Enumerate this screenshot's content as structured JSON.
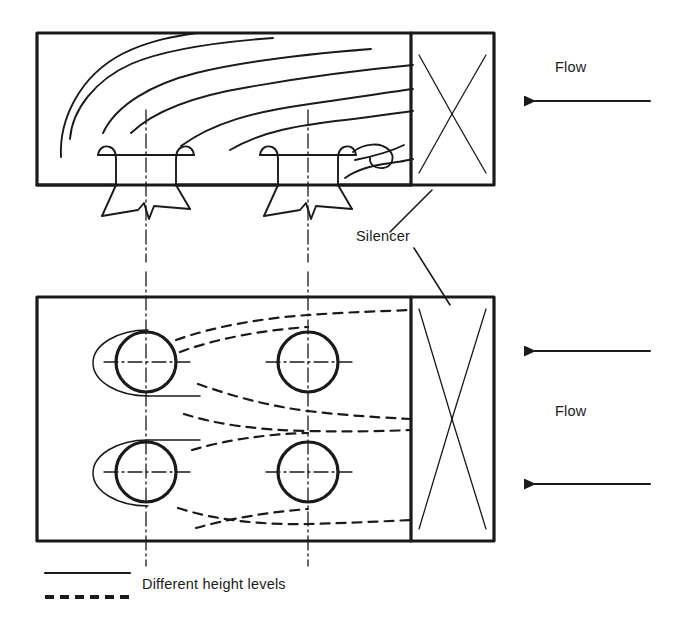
{
  "figure": {
    "background_color": "#ffffff",
    "line_color": "#1a1a1a",
    "width": 680,
    "height": 636
  },
  "labels": {
    "flow_top": "Flow",
    "flow_bottom": "Flow",
    "silencer": "Silencer"
  },
  "legend": {
    "entries": [
      {
        "style": "solid",
        "label": "Different height levels"
      },
      {
        "style": "dashed",
        "label": "Different height levels"
      }
    ],
    "caption": "Different height levels"
  },
  "views": {
    "top": {
      "name": "side-elevation-view",
      "enclosure": {
        "x": 37,
        "y": 33,
        "width": 457,
        "height": 152
      },
      "silencer_section": {
        "x": 411,
        "y": 33,
        "width": 83,
        "height": 152
      },
      "stacks": 2,
      "streamlines": 6
    },
    "bottom": {
      "name": "plan-view",
      "enclosure": {
        "x": 37,
        "y": 297,
        "width": 457,
        "height": 244
      },
      "silencer_section": {
        "x": 411,
        "y": 297,
        "width": 83,
        "height": 244
      },
      "fans": 4,
      "streamlines": 6
    }
  },
  "arrows": {
    "top": [
      {
        "name": "flow-arrow-top",
        "from_x": 650,
        "to_x": 528,
        "y": 101
      }
    ],
    "bottom": [
      {
        "name": "flow-arrow-bottom-1",
        "from_x": 650,
        "to_x": 528,
        "y": 351
      },
      {
        "name": "flow-arrow-bottom-2",
        "from_x": 650,
        "to_x": 528,
        "y": 484
      }
    ]
  }
}
